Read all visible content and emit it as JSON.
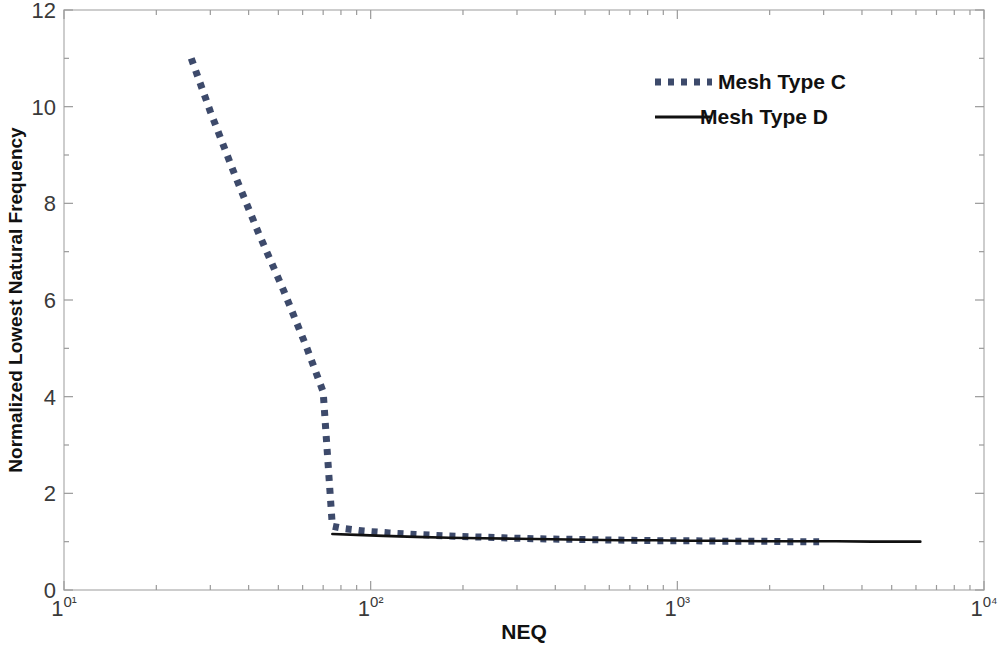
{
  "chart_data": {
    "type": "line",
    "title": "",
    "xlabel": "NEQ",
    "ylabel": "Normalized Lowest Natural Frequency",
    "xscale": "log",
    "yscale": "linear",
    "xlim": [
      10,
      10000
    ],
    "ylim": [
      0,
      12
    ],
    "grid": false,
    "legend_position": "top-right",
    "x_tick_labels": [
      "10¹",
      "10²",
      "10³",
      "10⁴"
    ],
    "x_tick_values": [
      10,
      100,
      1000,
      10000
    ],
    "y_tick_labels": [
      "0",
      "2",
      "4",
      "6",
      "8",
      "10",
      "12"
    ],
    "y_tick_values": [
      0,
      2,
      4,
      6,
      8,
      10,
      12
    ],
    "series": [
      {
        "name": "Mesh Type C",
        "style": "dotted",
        "color": "#3d4a6b",
        "x": [
          26,
          30,
          36,
          43,
          52,
          62,
          70,
          75,
          82,
          95,
          115,
          140,
          175,
          215,
          270,
          340,
          430,
          540,
          680,
          860,
          1100,
          1400,
          1800,
          2300,
          2900
        ],
        "y": [
          11.0,
          9.9,
          8.6,
          7.4,
          6.2,
          5.0,
          4.1,
          1.32,
          1.27,
          1.22,
          1.18,
          1.15,
          1.12,
          1.1,
          1.08,
          1.06,
          1.05,
          1.04,
          1.03,
          1.02,
          1.02,
          1.01,
          1.01,
          1.0,
          1.0
        ]
      },
      {
        "name": "Mesh Type D",
        "style": "solid",
        "color": "#111111",
        "x": [
          75,
          90,
          110,
          140,
          180,
          230,
          300,
          390,
          500,
          650,
          850,
          1100,
          1450,
          1900,
          2500,
          3300,
          4300,
          5600,
          6200
        ],
        "y": [
          1.16,
          1.14,
          1.12,
          1.1,
          1.08,
          1.07,
          1.06,
          1.05,
          1.04,
          1.03,
          1.03,
          1.02,
          1.02,
          1.01,
          1.01,
          1.01,
          1.0,
          1.0,
          1.0
        ]
      }
    ]
  },
  "legend": {
    "entries": [
      {
        "label": "Mesh Type C"
      },
      {
        "label": "Mesh Type D"
      }
    ]
  },
  "axes": {
    "x_title": "NEQ",
    "y_title": "Normalized Lowest Natural Frequency"
  }
}
